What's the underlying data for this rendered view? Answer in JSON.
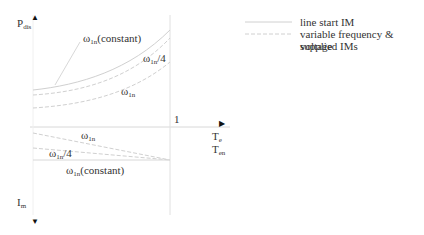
{
  "axes": {
    "top_ylabel": {
      "base": "P",
      "sub": "dis"
    },
    "bottom_ylabel": {
      "base": "I",
      "sub": "m"
    },
    "xlabel_1": {
      "base": "T",
      "sub": "e"
    },
    "xlabel_2": {
      "base": "T",
      "sub": "en"
    },
    "x_tick": "1",
    "arrow_up": "▲",
    "arrow_down": "▼",
    "arrow_right": "▶"
  },
  "upper_curves": [
    {
      "base": "ω",
      "sub": "1n",
      "suffix": "(constant)"
    },
    {
      "base": "ω",
      "sub": "1n",
      "suffix": "/4"
    },
    {
      "base": "ω",
      "sub": "1n",
      "suffix": ""
    }
  ],
  "lower_curves": [
    {
      "base": "ω",
      "sub": "1n",
      "suffix": ""
    },
    {
      "base": "ω",
      "sub": "1n",
      "suffix": "/4"
    },
    {
      "base": "ω",
      "sub": "1n",
      "suffix": "(constant)"
    }
  ],
  "legend": {
    "items": [
      {
        "label": "line start IM",
        "style": "solid"
      },
      {
        "label": "variable frequency & voltage",
        "style": "dashed"
      },
      {
        "label": "supplied IMs",
        "style": "none"
      }
    ]
  },
  "colors": {
    "line": "#d0d0d0",
    "text": "#333333"
  }
}
